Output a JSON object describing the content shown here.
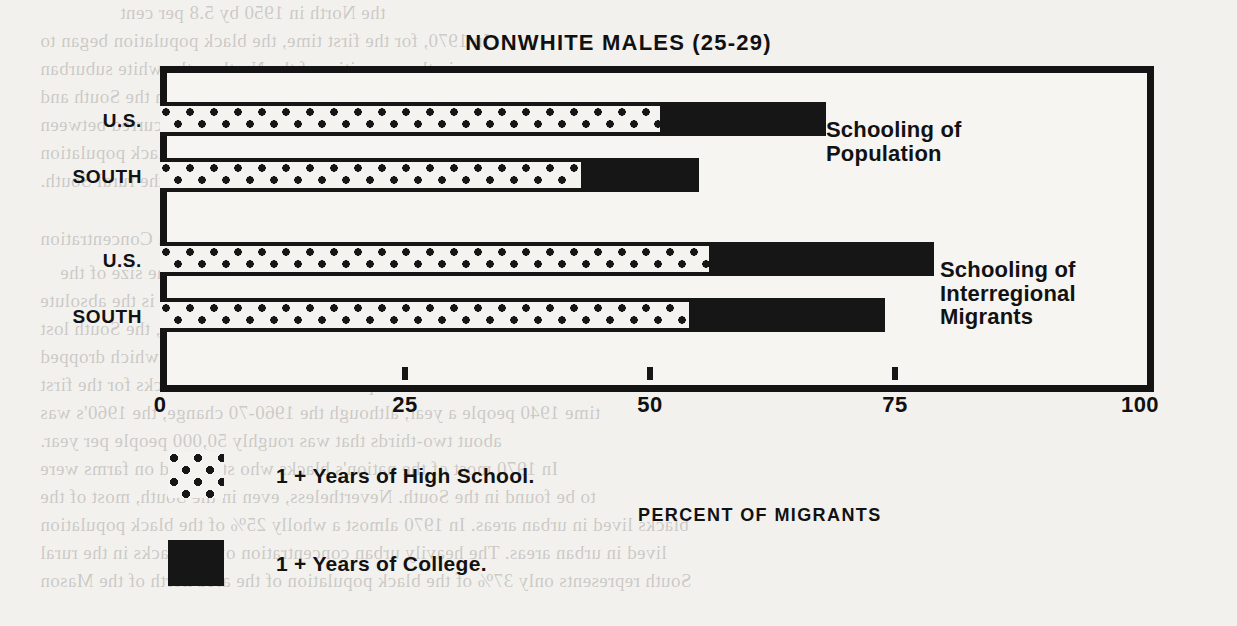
{
  "chart_data": {
    "type": "bar",
    "title": "NONWHITE MALES (25-29)",
    "xlabel": "PERCENT OF MIGRANTS",
    "ylabel": "",
    "orientation": "horizontal",
    "stacked": true,
    "xlim": [
      0,
      100
    ],
    "grid": false,
    "tick_labels": [
      "0",
      "25",
      "50",
      "75",
      "100"
    ],
    "tick_values": [
      0,
      25,
      50,
      75,
      100
    ],
    "categories": [
      "U.S.",
      "SOUTH",
      "U.S.",
      "SOUTH"
    ],
    "legend_position": "below-left",
    "series": [
      {
        "name": "1 + Years of High School.",
        "pattern": "dotted",
        "color": "#161616",
        "values": [
          51,
          43,
          56,
          74
        ]
      },
      {
        "name": "1 + Years of College.",
        "pattern": "solid",
        "color": "#161616",
        "values": [
          68,
          55,
          79,
          74
        ]
      }
    ],
    "bars": [
      {
        "label": "U.S.",
        "group": "Schooling of Population",
        "high_school": 51,
        "college": 68
      },
      {
        "label": "SOUTH",
        "group": "Schooling of Population",
        "high_school": 43,
        "college": 55
      },
      {
        "label": "U.S.",
        "group": "Schooling of Interregional Migrants",
        "high_school": 56,
        "college": 79
      },
      {
        "label": "SOUTH",
        "group": "Schooling of Interregional Migrants",
        "high_school": 54,
        "college": 74
      }
    ],
    "annotations": [
      {
        "text": "Schooling of\nPopulation",
        "x": 826,
        "y": 118
      },
      {
        "text": "Schooling of\nInterregional\nMigrants",
        "x": 940,
        "y": 258
      }
    ]
  },
  "bleed_text": [
    {
      "text": "the North in 1950 by 5.8 per cent",
      "x": 120,
      "y": 2
    },
    {
      "text": "In 1970, for the first time, the black population began to",
      "x": 40,
      "y": 30
    },
    {
      "text": "appear in the core cities of the North as the white suburban",
      "x": 40,
      "y": 58
    },
    {
      "text": "black population essentially all rural in the South and",
      "x": 40,
      "y": 86
    },
    {
      "text": "had increased. The first sizable migration occurred between",
      "x": 40,
      "y": 114
    },
    {
      "text": "1910 and 1920, when the northern urban black population",
      "x": 40,
      "y": 142
    },
    {
      "text": "is it was reduced in the rural South.",
      "x": 40,
      "y": 170
    },
    {
      "text": "Interregional Urban Concentration",
      "x": 40,
      "y": 228
    },
    {
      "text": "The most dramatic effect of the shifts in the size of the",
      "x": 60,
      "y": 262
    },
    {
      "text": "black population in the South and North is the absolute",
      "x": 40,
      "y": 290
    },
    {
      "text": "Southern states. Between 1940 and 1970, the South lost",
      "x": 40,
      "y": 318
    },
    {
      "text": "over 4.5 of the black population in the South, which dropped",
      "x": 40,
      "y": 346
    },
    {
      "text": "last below 53 per cent of the nation's blacks for the first",
      "x": 40,
      "y": 374
    },
    {
      "text": "time 1940 people a year, although the 1960-70 change, the 1960's was",
      "x": 40,
      "y": 402
    },
    {
      "text": "about two-thirds that was roughly 50,000 people per year.",
      "x": 40,
      "y": 430
    },
    {
      "text": "In 1970 most of the nation's blacks who still lived on farms were",
      "x": 40,
      "y": 458
    },
    {
      "text": "to be found in the South. Nevertheless, even in the South, most of the",
      "x": 40,
      "y": 486
    },
    {
      "text": "blacks lived in urban areas. In 1970 almost a wholly 25% of the black population",
      "x": 40,
      "y": 514
    },
    {
      "text": "lived in urban areas. The heavily urban concentration of the blacks in the rural",
      "x": 40,
      "y": 542
    },
    {
      "text": "South represents only 37% of the black population of the area north of the Mason",
      "x": 40,
      "y": 570
    }
  ]
}
